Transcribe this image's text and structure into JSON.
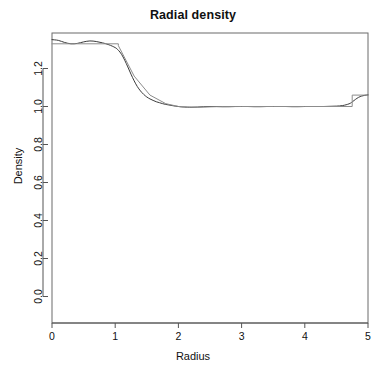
{
  "chart_data": {
    "type": "line",
    "title": "Radial density",
    "xlabel": "Radius",
    "ylabel": "Density",
    "xlim": [
      0,
      5
    ],
    "ylim": [
      0.0,
      1.385
    ],
    "xticks": [
      0,
      1,
      2,
      3,
      4,
      5
    ],
    "xtick_labels": [
      "0",
      "1",
      "2",
      "3",
      "4",
      "5"
    ],
    "yticks": [
      0.0,
      0.2,
      0.4,
      0.6,
      0.8,
      1.0,
      1.2
    ],
    "ytick_labels": [
      "0.0",
      "0.2",
      "0.4",
      "0.6",
      "0.8",
      "1.0",
      "1.2"
    ],
    "grid": false,
    "legend": "none",
    "box": true,
    "series": [
      {
        "name": "smoothed-density",
        "style": "smooth",
        "color": "#3a3a3a",
        "width": 1.0,
        "x": [
          0.0,
          0.1,
          0.2,
          0.3,
          0.4,
          0.5,
          0.6,
          0.7,
          0.8,
          0.9,
          1.0,
          1.05,
          1.1,
          1.15,
          1.2,
          1.25,
          1.3,
          1.35,
          1.4,
          1.45,
          1.5,
          1.55,
          1.6,
          1.65,
          1.7,
          1.75,
          1.8,
          1.85,
          1.9,
          1.95,
          2.0,
          2.05,
          2.1,
          2.2,
          2.3,
          2.4,
          2.5,
          2.6,
          2.7,
          2.8,
          2.9,
          3.0,
          3.1,
          3.2,
          3.3,
          3.4,
          3.5,
          3.6,
          3.7,
          3.8,
          3.9,
          4.0,
          4.1,
          4.2,
          4.3,
          4.4,
          4.5,
          4.6,
          4.7,
          4.75,
          4.8,
          4.85,
          4.9,
          4.95,
          5.0
        ],
        "y": [
          1.352,
          1.348,
          1.337,
          1.33,
          1.332,
          1.34,
          1.345,
          1.342,
          1.335,
          1.325,
          1.31,
          1.296,
          1.275,
          1.244,
          1.208,
          1.17,
          1.135,
          1.105,
          1.082,
          1.064,
          1.05,
          1.04,
          1.032,
          1.025,
          1.02,
          1.015,
          1.011,
          1.008,
          1.005,
          1.002,
          1.0,
          0.998,
          0.997,
          0.996,
          0.997,
          0.999,
          1.0,
          1.0,
          0.999,
          0.999,
          1.0,
          1.0,
          1.0,
          0.999,
          0.999,
          1.0,
          1.0,
          1.0,
          1.0,
          0.999,
          0.999,
          1.0,
          1.0,
          1.0,
          1.0,
          1.001,
          1.002,
          1.005,
          1.014,
          1.024,
          1.037,
          1.048,
          1.055,
          1.059,
          1.061
        ]
      },
      {
        "name": "step-density",
        "style": "step",
        "color": "#8c8c8c",
        "width": 1.0,
        "x": [
          0.0,
          1.05,
          1.05,
          1.3,
          1.55,
          1.8,
          2.0,
          2.15,
          2.3,
          2.6,
          3.0,
          3.5,
          4.0,
          4.4,
          4.75,
          4.75,
          5.0
        ],
        "y": [
          1.33,
          1.33,
          1.32,
          1.16,
          1.06,
          1.015,
          1.0,
          0.997,
          0.996,
          0.999,
          1.0,
          1.0,
          1.0,
          1.0,
          1.0,
          1.06,
          1.06
        ]
      }
    ]
  },
  "axes": {
    "tick_color": "#555555",
    "box_color": "#6b6b6b"
  }
}
